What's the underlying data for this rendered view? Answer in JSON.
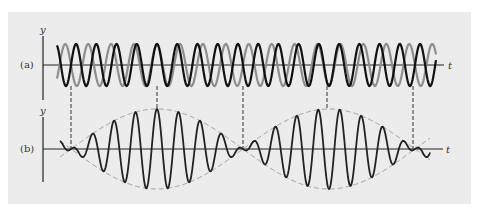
{
  "figure": {
    "panel_a": {
      "label": "(a)",
      "y_axis_label": "y",
      "t_axis_label": "t"
    },
    "panel_b": {
      "label": "(b)",
      "y_axis_label": "y",
      "t_axis_label": "t"
    }
  },
  "colors": {
    "background": "#ffffff",
    "panel": "#ececec",
    "wave_1": "#111111",
    "wave_2": "#8e8e8e",
    "sum_wave": "#222222",
    "envelope": "#9a9a9a",
    "axis": "#222222",
    "dash": "#333333"
  },
  "chart_data": {
    "type": "line",
    "panels": [
      {
        "id": "a",
        "label": "(a)",
        "description": "Two individual waves of slightly different frequencies",
        "xlabel": "t",
        "ylabel": "y",
        "series": [
          {
            "name": "wave 1 (black)",
            "period_px": 20.2,
            "amplitude": 1
          },
          {
            "name": "wave 2 (gray)",
            "period_px": 22.9,
            "amplitude": 1
          }
        ]
      },
      {
        "id": "b",
        "label": "(b)",
        "description": "Resultant wave with dashed envelope",
        "xlabel": "t",
        "ylabel": "y",
        "series": [
          {
            "name": "sum",
            "amplitude": 2
          },
          {
            "name": "envelope (dashed)",
            "style": "dashed"
          }
        ]
      }
    ],
    "beat_markers_px": [
      71,
      157,
      243,
      327,
      413
    ],
    "marker_meaning": [
      "out of phase",
      "in phase",
      "out of phase",
      "in phase",
      "out of phase"
    ],
    "grid": false
  }
}
